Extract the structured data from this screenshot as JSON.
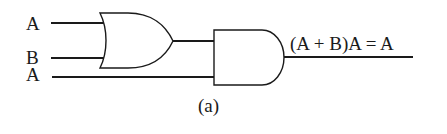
{
  "diagram": {
    "type": "logic-circuit",
    "inputs": [
      {
        "label": "A"
      },
      {
        "label": "B"
      },
      {
        "label": "A"
      }
    ],
    "gates": [
      {
        "type": "OR",
        "inputs": [
          "A",
          "B"
        ]
      },
      {
        "type": "AND",
        "inputs": [
          "OR output",
          "A"
        ]
      }
    ],
    "output_expression": "(A + B)A = A",
    "caption": "(a)",
    "colors": {
      "stroke": "#1a1a1a",
      "background": "#ffffff"
    }
  }
}
